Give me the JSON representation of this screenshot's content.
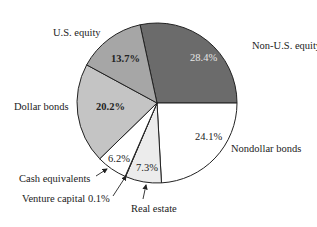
{
  "chart_data": {
    "type": "pie",
    "title": "",
    "center": [
      157,
      103
    ],
    "radius": 80,
    "start_angle_deg": -12.2,
    "slices": [
      {
        "label": "Non-U.S. equity",
        "value": 28.4,
        "pct_label": "28.4%",
        "color": "#6b6b6b",
        "pct_color": "#e6e6e6",
        "label_pos": [
          252,
          49
        ],
        "pct_pos": [
          190,
          61
        ],
        "pct_bold": false
      },
      {
        "label": "Nondollar bonds",
        "value": 24.1,
        "pct_label": "24.1%",
        "color": "#ffffff",
        "pct_color": "#222222",
        "label_pos": [
          231,
          152
        ],
        "pct_pos": [
          195,
          140
        ],
        "pct_bold": false
      },
      {
        "label": "Real estate",
        "value": 7.3,
        "pct_label": "7.3%",
        "color": "#ececec",
        "pct_color": "#222222",
        "label_pos": [
          131,
          212
        ],
        "pct_pos": [
          136,
          171
        ],
        "pct_bold": false
      },
      {
        "label": "Venture capital 0.1%",
        "value": 0.1,
        "pct_label": "",
        "color": "#ffffff",
        "pct_color": "#222222",
        "label_pos": [
          22,
          202
        ],
        "pct_pos": [
          0,
          0
        ],
        "pct_bold": false
      },
      {
        "label": "Cash equivalents",
        "value": 6.2,
        "pct_label": "6.2%",
        "color": "#ffffff",
        "pct_color": "#222222",
        "label_pos": [
          19,
          182
        ],
        "pct_pos": [
          108,
          162
        ],
        "pct_bold": false
      },
      {
        "label": "Dollar bonds",
        "value": 20.2,
        "pct_label": "20.2%",
        "color": "#c4c4c4",
        "pct_color": "#222222",
        "label_pos": [
          14,
          110
        ],
        "pct_pos": [
          96,
          110
        ],
        "pct_bold": true
      },
      {
        "label": "U.S. equity",
        "value": 13.7,
        "pct_label": "13.7%",
        "color": "#a6a6a6",
        "pct_color": "#222222",
        "label_pos": [
          53,
          36
        ],
        "pct_pos": [
          111,
          62
        ],
        "pct_bold": true
      }
    ],
    "annotations": [
      {
        "text": "Cash equivalents",
        "arrow_from": [
          96,
          176
        ],
        "arrow_to": [
          107,
          169
        ]
      },
      {
        "text": "Venture capital 0.1%",
        "arrow_from": [
          113,
          196
        ],
        "arrow_to": [
          126,
          176
        ]
      },
      {
        "text": "Real estate",
        "arrow_from": [
          143,
          199
        ],
        "arrow_to": [
          146,
          185
        ]
      }
    ],
    "legend": "none"
  }
}
